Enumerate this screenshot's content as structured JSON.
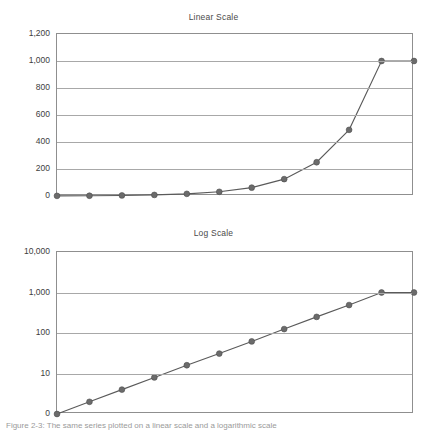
{
  "figure": {
    "caption": "Figure 2-3: The same series plotted on a linear scale and a logarithmic scale"
  },
  "colors": {
    "line": "#5a5a5a",
    "marker": "#6b6b6b",
    "grid": "#a8a8a8",
    "axis": "#8f8f8f",
    "text": "#3d3d3d"
  },
  "chart_data": [
    {
      "type": "line",
      "id": "linear",
      "title": "Linear Scale",
      "xlabel": "",
      "ylabel": "",
      "yscale": "linear",
      "ylim": [
        0,
        1200
      ],
      "ytick_labels": [
        "1,200",
        "1,000",
        "800",
        "600",
        "400",
        "200",
        "0"
      ],
      "ytick_values": [
        1200,
        1000,
        800,
        600,
        400,
        200,
        0
      ],
      "grid": true,
      "legend": "none",
      "x": [
        0,
        1,
        2,
        3,
        4,
        5,
        6,
        7,
        8,
        9,
        10,
        11
      ],
      "values": [
        1,
        2,
        4,
        8,
        16,
        31,
        62,
        125,
        250,
        490,
        1000,
        1000
      ],
      "series": [
        {
          "name": "doubling",
          "values": [
            1,
            2,
            4,
            8,
            16,
            31,
            62,
            125,
            250,
            490,
            1000,
            1000
          ]
        }
      ]
    },
    {
      "type": "line",
      "id": "log",
      "title": "Log Scale",
      "xlabel": "",
      "ylabel": "",
      "yscale": "log",
      "ylim": [
        1,
        10000
      ],
      "ytick_labels": [
        "10,000",
        "1,000",
        "100",
        "10",
        "0"
      ],
      "ytick_values": [
        10000,
        1000,
        100,
        10,
        1
      ],
      "grid": true,
      "legend": "none",
      "x": [
        0,
        1,
        2,
        3,
        4,
        5,
        6,
        7,
        8,
        9,
        10,
        11
      ],
      "values": [
        1,
        2,
        4,
        8,
        16,
        31,
        62,
        125,
        250,
        490,
        1000,
        1000
      ],
      "series": [
        {
          "name": "doubling",
          "values": [
            1,
            2,
            4,
            8,
            16,
            31,
            62,
            125,
            250,
            490,
            1000,
            1000
          ]
        }
      ]
    }
  ]
}
